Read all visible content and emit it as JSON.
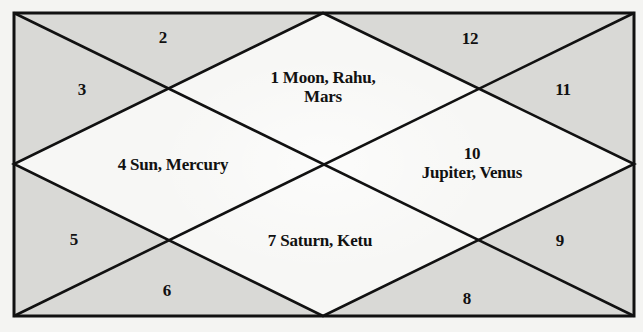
{
  "diagram": {
    "type": "north-indian-kundli",
    "colors": {
      "page_bg": "#f4f4f2",
      "corner_fill": "#d9d9d6",
      "center_fill": "#f7f7f5",
      "line": "#111111",
      "text": "#111111"
    },
    "frame": {
      "x1": 14,
      "y1": 13,
      "x2": 634,
      "y2": 316
    },
    "houses": [
      {
        "house": 1,
        "label": "1",
        "planets": "Moon, Rahu, Mars",
        "line1": "1 Moon, Rahu,",
        "line2": "Mars",
        "x": 323,
        "y": 87
      },
      {
        "house": 2,
        "label": "2",
        "planets": "",
        "x": 163,
        "y": 37
      },
      {
        "house": 3,
        "label": "3",
        "planets": "",
        "x": 82,
        "y": 89
      },
      {
        "house": 4,
        "label": "4",
        "planets": "Sun, Mercury",
        "line1": "4 Sun, Mercury",
        "x": 173,
        "y": 164
      },
      {
        "house": 5,
        "label": "5",
        "planets": "",
        "x": 74,
        "y": 239
      },
      {
        "house": 6,
        "label": "6",
        "planets": "",
        "x": 167,
        "y": 290
      },
      {
        "house": 7,
        "label": "7",
        "planets": "Saturn, Ketu",
        "line1": "7 Saturn, Ketu",
        "x": 320,
        "y": 240
      },
      {
        "house": 8,
        "label": "8",
        "planets": "",
        "x": 467,
        "y": 298
      },
      {
        "house": 9,
        "label": "9",
        "planets": "",
        "x": 560,
        "y": 240
      },
      {
        "house": 10,
        "label": "10",
        "planets": "Jupiter, Venus",
        "line1": "10",
        "line2": "Jupiter, Venus",
        "x": 472,
        "y": 163
      },
      {
        "house": 11,
        "label": "11",
        "planets": "",
        "x": 563,
        "y": 89
      },
      {
        "house": 12,
        "label": "12",
        "planets": "",
        "x": 470,
        "y": 38
      }
    ]
  }
}
